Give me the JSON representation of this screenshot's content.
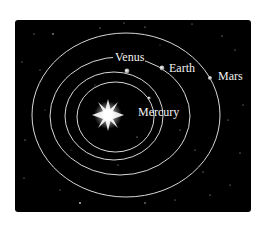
{
  "diagram": {
    "background_color": "#000000",
    "orbit_color": "#d8d8d8",
    "sun": {
      "label": "",
      "cx": 108,
      "cy": 115
    },
    "planets": [
      {
        "name": "Mercury",
        "label": "Mercury",
        "order": 1,
        "dot": [
          149,
          98
        ],
        "label_pos": [
          138,
          116
        ]
      },
      {
        "name": "Venus",
        "label": "Venus",
        "order": 2,
        "dot": [
          127,
          71
        ],
        "label_pos": [
          115,
          61
        ]
      },
      {
        "name": "Earth",
        "label": "Earth",
        "order": 3,
        "dot": [
          162,
          68
        ],
        "label_pos": [
          170,
          72
        ]
      },
      {
        "name": "Mars",
        "label": "Mars",
        "order": 4,
        "dot": [
          210,
          78
        ],
        "label_pos": [
          218,
          80
        ]
      }
    ]
  }
}
